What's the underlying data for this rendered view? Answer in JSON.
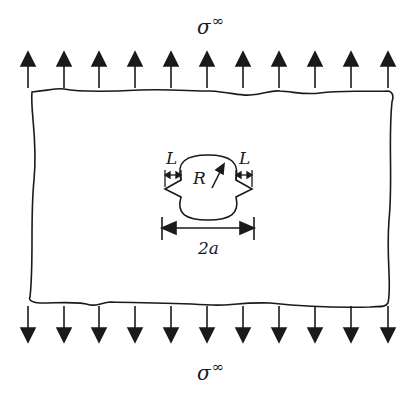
{
  "diagram": {
    "top_stress_label": {
      "symbol": "σ",
      "superscript": "∞"
    },
    "bottom_stress_label": {
      "symbol": "σ",
      "superscript": "∞"
    },
    "hole_labels": {
      "left_crack": "L",
      "right_crack": "L",
      "radius": "R",
      "total_width": "2a"
    },
    "arrow_count_top": 11,
    "arrow_count_bottom": 11,
    "colors": {
      "ink": "#1a1a1a",
      "background": "#ffffff"
    }
  }
}
